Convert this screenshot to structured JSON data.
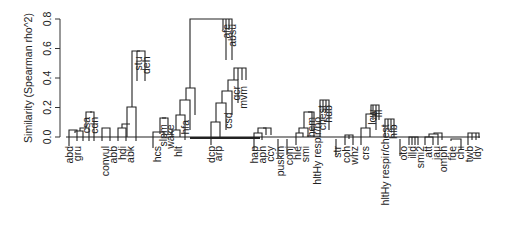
{
  "chart_data": {
    "type": "dendrogram",
    "title": "",
    "xlabel": "",
    "ylabel": "Similarity (Spearman rho^2)",
    "ylim": [
      0,
      0.8
    ],
    "yticks": [
      "0.0",
      "0.2",
      "0.4",
      "0.6",
      "0.8"
    ],
    "ytick_values": [
      0.0,
      0.2,
      0.4,
      0.6,
      0.8
    ],
    "grid": false,
    "legend": null,
    "leaves": [
      {
        "label": "abd",
        "x": 69,
        "h": 0.0
      },
      {
        "label": "gru",
        "x": 77,
        "h": 0.03
      },
      {
        "label": "csa",
        "x": 86,
        "h": 0.17
      },
      {
        "label": "cdn",
        "x": 94,
        "h": 0.17
      },
      {
        "label": "convul",
        "x": 105,
        "h": 0.06
      },
      {
        "label": "abb",
        "x": 113,
        "h": 0.06
      },
      {
        "label": "hdi",
        "x": 122,
        "h": 0.03
      },
      {
        "label": "abk",
        "x": 130,
        "h": 0.07
      },
      {
        "label": "stu",
        "x": 138,
        "h": 0.58
      },
      {
        "label": "deh",
        "x": 146,
        "h": 0.58
      },
      {
        "label": "hcs",
        "x": 157,
        "h": 0.0
      },
      {
        "label": "slpm",
        "x": 163,
        "h": 0.12
      },
      {
        "label": "wake",
        "x": 170,
        "h": 0.12
      },
      {
        "label": "hlt",
        "x": 178,
        "h": 0.05
      },
      {
        "label": "hfa",
        "x": 185,
        "h": 0.15
      },
      {
        "label": "afe",
        "x": 226,
        "h": 0.8
      },
      {
        "label": "absu",
        "x": 232,
        "h": 0.8
      },
      {
        "label": "dcp",
        "x": 211,
        "h": 0.0
      },
      {
        "label": "arp",
        "x": 218,
        "h": 0.04
      },
      {
        "label": "csd",
        "x": 228,
        "h": 0.2
      },
      {
        "label": "qcr",
        "x": 236,
        "h": 0.38
      },
      {
        "label": "mvm",
        "x": 243,
        "h": 0.38
      },
      {
        "label": "hap",
        "x": 254,
        "h": 0.0
      },
      {
        "label": "apn",
        "x": 262,
        "h": 0.03
      },
      {
        "label": "ccy",
        "x": 270,
        "h": 0.05
      },
      {
        "label": "puskin",
        "x": 280,
        "h": 0.0
      },
      {
        "label": "conj",
        "x": 289,
        "h": 0.0
      },
      {
        "label": "hle",
        "x": 297,
        "h": 0.01
      },
      {
        "label": "smi",
        "x": 305,
        "h": 0.03
      },
      {
        "label": "hem",
        "x": 311,
        "h": 0.17
      },
      {
        "label": "hltHy respir/no",
        "x": 317,
        "h": 0.17
      },
      {
        "label": "chest",
        "x": 322,
        "h": 0.25
      },
      {
        "label": "hdb",
        "x": 328,
        "h": 0.25
      },
      {
        "label": "str",
        "x": 337,
        "h": 0.0
      },
      {
        "label": "coh",
        "x": 346,
        "h": 0.0
      },
      {
        "label": "whz",
        "x": 354,
        "h": 0.0
      },
      {
        "label": "crs",
        "x": 365,
        "h": 0.02
      },
      {
        "label": "lcw",
        "x": 372,
        "h": 0.22
      },
      {
        "label": "lfl",
        "x": 378,
        "h": 0.22
      },
      {
        "label": "hltHy respir/chest",
        "x": 385,
        "h": 0.12
      },
      {
        "label": "hfb",
        "x": 393,
        "h": 0.12
      },
      {
        "label": "oto",
        "x": 403,
        "h": 0.0
      },
      {
        "label": "illd",
        "x": 412,
        "h": 0.0
      },
      {
        "label": "smi2",
        "x": 420,
        "h": 0.0
      },
      {
        "label": "att",
        "x": 428,
        "h": 0.0
      },
      {
        "label": "jau",
        "x": 436,
        "h": 0.02
      },
      {
        "label": "omph",
        "x": 443,
        "h": 0.02
      },
      {
        "label": "fde",
        "x": 452,
        "h": 0.0
      },
      {
        "label": "chi",
        "x": 460,
        "h": 0.0
      },
      {
        "label": "twb",
        "x": 469,
        "h": 0.03
      },
      {
        "label": "ldy",
        "x": 477,
        "h": 0.03
      }
    ],
    "merges": [
      {
        "pair": [
          "csa",
          "cdn"
        ],
        "height": 0.17
      },
      {
        "pair": [
          "stu",
          "deh"
        ],
        "height": 0.58
      },
      {
        "pair": [
          "afe",
          "absu"
        ],
        "height": 0.8
      },
      {
        "pair": [
          "qcr",
          "mvm"
        ],
        "height": 0.38
      },
      {
        "pair": [
          "chest",
          "hdb"
        ],
        "height": 0.25
      },
      {
        "pair": [
          "lcw",
          "lfl"
        ],
        "height": 0.22
      },
      {
        "pair": [
          "slpm",
          "wake"
        ],
        "height": 0.12
      },
      {
        "pair": [
          "smi",
          "hem"
        ],
        "height": 0.17
      },
      {
        "pair": [
          "hltHy respir/chest",
          "hfb"
        ],
        "height": 0.12
      },
      {
        "pair": [
          "abk",
          "stu/deh"
        ],
        "height": 0.2
      },
      {
        "pair": [
          "hfa",
          "afe/absu"
        ],
        "height": 0.25
      },
      {
        "pair": [
          "csd",
          "qcr/mvm"
        ],
        "height": 0.3
      },
      {
        "pair": [
          "arp",
          "csd cluster"
        ],
        "height": 0.22
      }
    ]
  }
}
